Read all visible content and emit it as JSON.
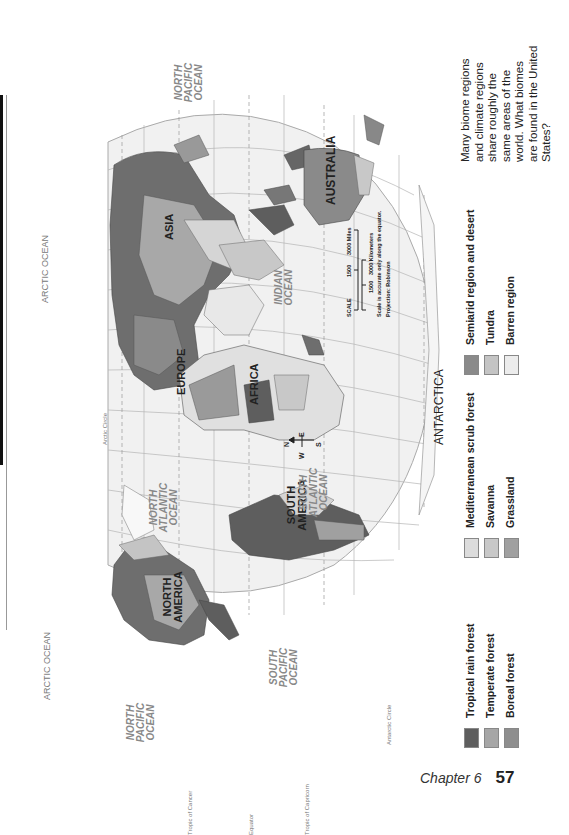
{
  "page": {
    "chapter_label": "Chapter 6",
    "page_number": "57",
    "orientation": "map rotated 90 degrees; north points left"
  },
  "caption": {
    "text": "Many biome regions and climate regions share roughly the same areas of the world. What biomes are found in the United States?"
  },
  "legend": {
    "items": [
      {
        "label": "Tropical rain forest",
        "color": "#5e5e5e"
      },
      {
        "label": "Temperate forest",
        "color": "#a6a6a6"
      },
      {
        "label": "Boreal forest",
        "color": "#8e8e8e"
      },
      {
        "label": "Mediterranean scrub forest",
        "color": "#dcdcdc"
      },
      {
        "label": "Savanna",
        "color": "#c8c8c8"
      },
      {
        "label": "Grassland",
        "color": "#a0a0a0"
      },
      {
        "label": "Semiarid region and desert",
        "color": "#8a8a8a"
      },
      {
        "label": "Tundra",
        "color": "#c4c4c4"
      },
      {
        "label": "Barren region",
        "color": "#ececec"
      }
    ]
  },
  "map": {
    "continents": [
      "NORTH AMERICA",
      "SOUTH AMERICA",
      "EUROPE",
      "AFRICA",
      "ASIA",
      "AUSTRALIA",
      "ANTARCTICA"
    ],
    "oceans": {
      "north_pacific_left": "NORTH PACIFIC OCEAN",
      "north_pacific_right": "NORTH PACIFIC OCEAN",
      "south_pacific": "SOUTH PACIFIC OCEAN",
      "north_atlantic": "NORTH ATLANTIC OCEAN",
      "south_atlantic": "SOUTH ATLANTIC OCEAN",
      "indian": "INDIAN OCEAN",
      "arctic_top": "ARCTIC OCEAN",
      "arctic_bottom": "ARCTIC OCEAN"
    },
    "lines": {
      "tropic_cancer": "Tropic of Cancer",
      "equator": "Equator",
      "tropic_capricorn": "Tropic of Capricorn",
      "arctic_circle": "Arctic Circle",
      "antarctic_circle": "Antarctic Circle"
    },
    "longitudes": [
      "160°W",
      "140°W",
      "120°W",
      "100°W",
      "80°W",
      "60°W",
      "40°W",
      "20°W",
      "0°",
      "20°E",
      "40°E",
      "60°E",
      "80°E",
      "100°E",
      "120°E",
      "140°E",
      "160°E"
    ],
    "latitudes": [
      "60°N",
      "40°N",
      "20°N",
      "0°",
      "20°S",
      "40°S",
      "60°S"
    ],
    "compass": {
      "n": "N",
      "s": "S",
      "e": "E",
      "w": "W"
    },
    "scale": {
      "title": "SCALE",
      "miles_ticks": [
        "0",
        "1500",
        "3000 Miles"
      ],
      "km_ticks": [
        "0",
        "1500",
        "3000 Kilometers"
      ],
      "note": "Scale is accurate only along the equator.",
      "projection": "Projection: Robinson"
    }
  }
}
